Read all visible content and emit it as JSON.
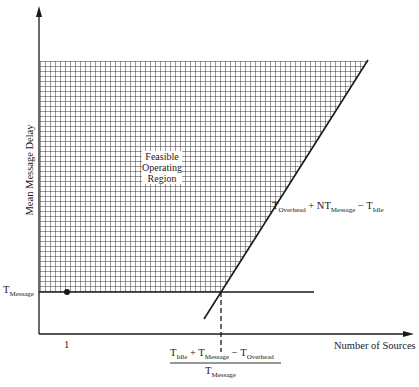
{
  "diagram": {
    "axes": {
      "y_label": "Mean Message Delay",
      "x_label": "Number of Sources",
      "x_tick": "1"
    },
    "region_label": [
      "Feasible",
      "Operating",
      "Region"
    ],
    "horizontal_line_label": {
      "base": "T",
      "sub": "Message"
    },
    "diagonal_line_label": {
      "t1": "T",
      "s1": "Overhead",
      "plus": " + NT",
      "s2": "Message",
      "minus": " − T",
      "s3": "Idle"
    },
    "intersection_label": {
      "numerator": {
        "t1": "T",
        "s1": "Idle",
        "plus": " + T",
        "s2": "Message",
        "minus": " − T",
        "s3": "Overhead"
      },
      "denominator": {
        "t": "T",
        "s": "Message"
      }
    },
    "colors": {
      "ink": "#1a1a1a",
      "grid": "#222222",
      "background": "#ffffff"
    }
  }
}
